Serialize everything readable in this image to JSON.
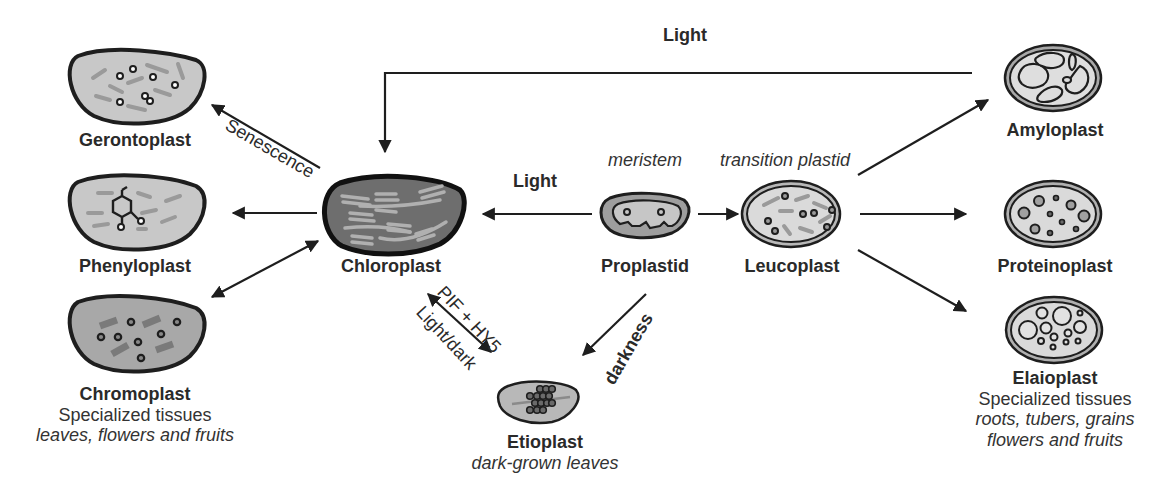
{
  "diagram": {
    "colors": {
      "outline": "#1e1e1e",
      "fill_light": "#c8c8c8",
      "fill_medium": "#a6a6a6",
      "fill_chloroplast": "#6e6e6e",
      "fill_leuco": "#d6d6d6",
      "thylakoid": "#9a9a9a",
      "background": "#ffffff"
    },
    "nodes": {
      "gerontoplast": {
        "name": "Gerontoplast"
      },
      "phenyloplast": {
        "name": "Phenyloplast"
      },
      "chromoplast": {
        "name": "Chromoplast",
        "sub": "Specialized tissues",
        "italic": "leaves, flowers and fruits"
      },
      "chloroplast": {
        "name": "Chloroplast"
      },
      "proplastid": {
        "name": "Proplastid",
        "above_italic": "meristem"
      },
      "leucoplast": {
        "name": "Leucoplast",
        "above_italic": "transition plastid"
      },
      "etioplast": {
        "name": "Etioplast",
        "italic": "dark-grown leaves"
      },
      "amyloplast": {
        "name": "Amyloplast"
      },
      "proteinoplast": {
        "name": "Proteinoplast"
      },
      "elaioplast": {
        "name": "Elaioplast",
        "sub": "Specialized tissues",
        "italic_1": "roots, tubers, grains",
        "italic_2": "flowers and fruits"
      }
    },
    "edges": {
      "amyloplast_to_chloroplast": "Light",
      "proplastid_to_chloroplast": "Light",
      "chloroplast_to_gerontoplast": "Senescence",
      "chloroplast_etioplast_top": "PIF + HY5",
      "chloroplast_etioplast_bottom": "Light/dark",
      "proplastid_to_etioplast": "darkness"
    }
  }
}
